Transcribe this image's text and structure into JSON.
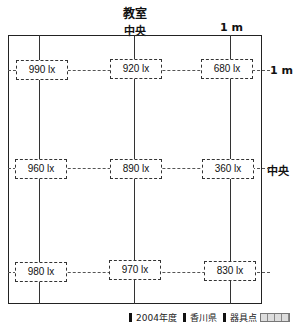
{
  "title": "教室",
  "labels": {
    "top_center": "中央",
    "top_right": "1 m",
    "right_top": "1 m",
    "right_center": "中央"
  },
  "grid": {
    "rows": [
      [
        "990 lx",
        "920 lx",
        "680 lx"
      ],
      [
        "960 lx",
        "890 lx",
        "360 lx"
      ],
      [
        "980 lx",
        "970 lx",
        "830 lx"
      ]
    ]
  },
  "footer": {
    "items": [
      "2004年度",
      "香川県",
      "器具点"
    ]
  }
}
